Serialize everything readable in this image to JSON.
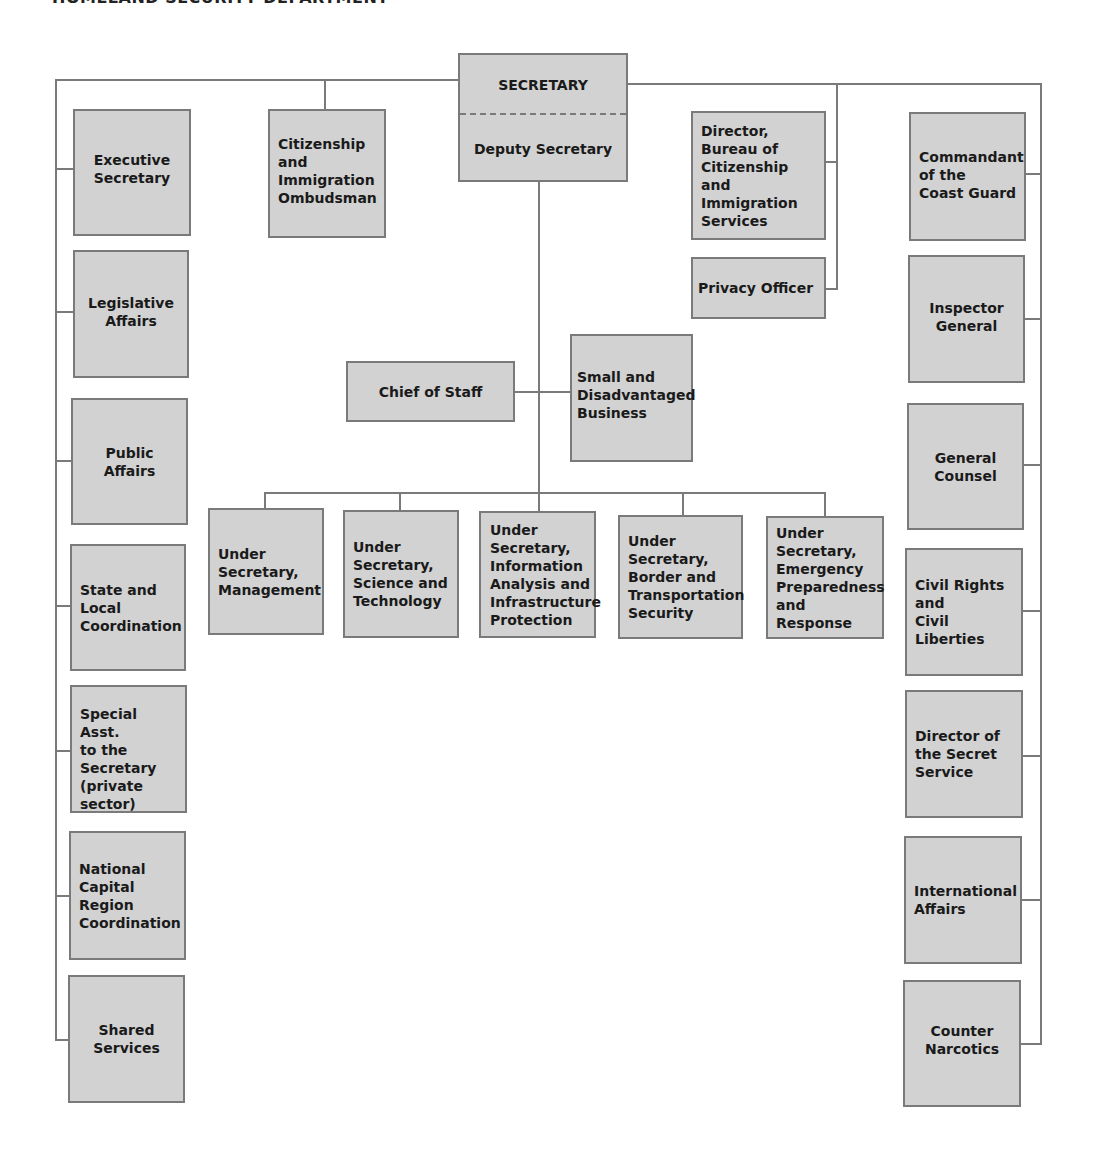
{
  "title": "HOMELAND SECURITY DEPARTMENT",
  "colors": {
    "box_fill": "#d2d2d2",
    "box_border": "#7a7a7a",
    "line": "#7a7a7a",
    "text": "#1a1a1a"
  },
  "top": {
    "secretary": "SECRETARY",
    "deputy": "Deputy Secretary",
    "ombudsman": "Citizenship\nand\nImmigration\nOmbudsman",
    "director_bcis": "Director,\nBureau of\nCitizenship and\nImmigration\nServices",
    "privacy_officer": "Privacy Officer"
  },
  "middle": {
    "chief_of_staff": "Chief of Staff",
    "small_business": "Small and\nDisadvantaged\nBusiness"
  },
  "under_secretaries": [
    "Under\nSecretary,\nManagement",
    "Under\nSecretary,\nScience and\nTechnology",
    "Under\nSecretary,\nInformation\nAnalysis and\nInfrastructure\nProtection",
    "Under\nSecretary,\nBorder and\nTransportation\nSecurity",
    "Under\nSecretary,\nEmergency\nPreparedness\nand Response"
  ],
  "left_column": [
    "Executive\nSecretary",
    "Legislative\nAffairs",
    "Public\nAffairs",
    "State and\nLocal\nCoordination",
    "Special Asst.\nto the\nSecretary\n(private\nsector)",
    "National\nCapital\nRegion\nCoordination",
    "Shared\nServices"
  ],
  "right_column": [
    "Commandant\nof the\nCoast Guard",
    "Inspector\nGeneral",
    "General\nCounsel",
    "Civil Rights\nand\nCivil Liberties",
    "Director of\nthe Secret\nService",
    "International\nAffairs",
    "Counter\nNarcotics"
  ]
}
